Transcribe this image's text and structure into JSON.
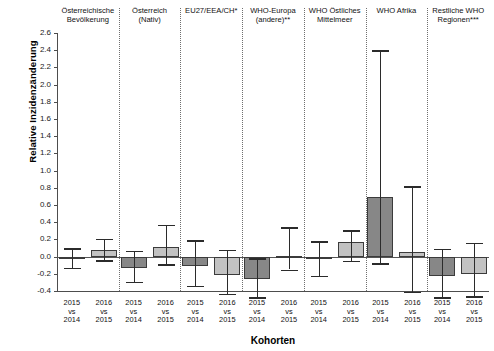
{
  "chart_data": {
    "type": "bar",
    "title": "",
    "xlabel": "Kohorten",
    "ylabel": "Relative Inzidenzänderung",
    "ylim": [
      -0.4,
      2.6
    ],
    "yticks": [
      "2.6",
      "2.4",
      "2.2",
      "2.0",
      "1.8",
      "1.6",
      "1.4",
      "1.2",
      "1.0",
      "0.8",
      "0.6",
      "0.4",
      "0.2",
      "0.0",
      "-0.2",
      "-0.4"
    ],
    "grid": false,
    "legend": "none",
    "zero_reference_line": true,
    "group_separator_style": "dotted",
    "groups": [
      {
        "label": "Österreichische\nBevölkerung",
        "bars": [
          {
            "label": "2015\nvs\n2014",
            "value": -0.02,
            "ci_low": -0.13,
            "ci_high": 0.1,
            "fill": "dark"
          },
          {
            "label": "2016\nvs\n2015",
            "value": 0.08,
            "ci_low": -0.04,
            "ci_high": 0.21,
            "fill": "light"
          }
        ]
      },
      {
        "label": "Österreich\n(Nativ)",
        "bars": [
          {
            "label": "2015\nvs\n2014",
            "value": -0.13,
            "ci_low": -0.29,
            "ci_high": 0.07,
            "fill": "dark"
          },
          {
            "label": "2016\nvs\n2015",
            "value": 0.11,
            "ci_low": -0.09,
            "ci_high": 0.37,
            "fill": "light"
          }
        ]
      },
      {
        "label": "EU27/EEA/CH*",
        "bars": [
          {
            "label": "2015\nvs\n2014",
            "value": -0.11,
            "ci_low": -0.34,
            "ci_high": 0.19,
            "fill": "dark"
          },
          {
            "label": "2016\nvs\n2015",
            "value": -0.21,
            "ci_low": -0.43,
            "ci_high": 0.08,
            "fill": "light"
          }
        ]
      },
      {
        "label": "WHO-Europa\n(andere)**",
        "bars": [
          {
            "label": "2015\nvs\n2014",
            "value": -0.26,
            "ci_low": -0.47,
            "ci_high": -0.02,
            "fill": "dark"
          },
          {
            "label": "2016\nvs\n2015",
            "value": 0.01,
            "ci_low": -0.15,
            "ci_high": 0.34,
            "fill": "light"
          }
        ]
      },
      {
        "label": "WHO Östliches\nMittelmeer",
        "bars": [
          {
            "label": "2015\nvs\n2014",
            "value": -0.01,
            "ci_low": -0.22,
            "ci_high": 0.18,
            "fill": "dark"
          },
          {
            "label": "2016\nvs\n2015",
            "value": 0.17,
            "ci_low": -0.05,
            "ci_high": 0.31,
            "fill": "light"
          }
        ]
      },
      {
        "label": "WHO Afrika",
        "bars": [
          {
            "label": "2015\nvs\n2014",
            "value": 0.69,
            "ci_low": -0.08,
            "ci_high": 2.4,
            "fill": "dark"
          },
          {
            "label": "2016\nvs\n2015",
            "value": 0.05,
            "ci_low": -0.41,
            "ci_high": 0.82,
            "fill": "light"
          }
        ]
      },
      {
        "label": "Restliche WHO\nRegionen***",
        "bars": [
          {
            "label": "2015\nvs\n2014",
            "value": -0.22,
            "ci_low": -0.47,
            "ci_high": 0.09,
            "fill": "dark"
          },
          {
            "label": "2016\nvs\n2015",
            "value": -0.2,
            "ci_low": -0.46,
            "ci_high": 0.16,
            "fill": "light"
          }
        ]
      }
    ]
  },
  "colors": {
    "bar_dark": "#878787",
    "bar_light": "#c2c2c2",
    "bar_edge": "#3b3b3b",
    "axis": "#4d4d4d",
    "separator": "#6f6f6f",
    "background": "#ffffff"
  }
}
